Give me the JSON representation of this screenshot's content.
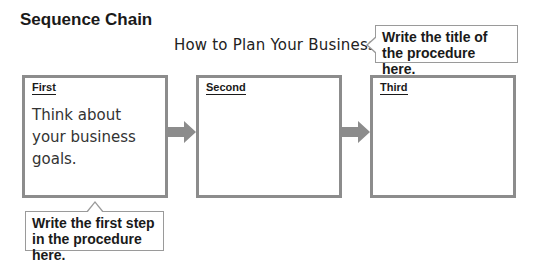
{
  "heading": "Sequence Chain",
  "procedure_title": "How to Plan Your Business",
  "callouts": {
    "title_hint": "Write the title of the procedure here.",
    "first_step_hint": "Write the first step in the procedure here."
  },
  "steps": [
    {
      "label": "First",
      "content": "Think about your business goals."
    },
    {
      "label": "Second",
      "content": ""
    },
    {
      "label": "Third",
      "content": ""
    }
  ],
  "colors": {
    "box_border": "#8c8c8c",
    "arrow": "#8c8c8c",
    "callout_border": "#9a9a9a"
  }
}
